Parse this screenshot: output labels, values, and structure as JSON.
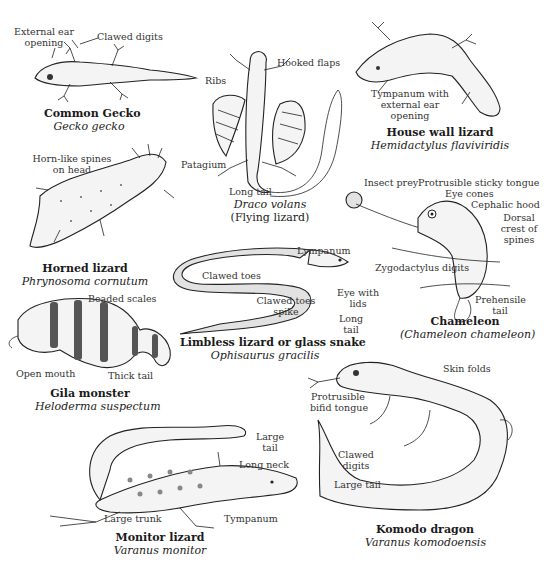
{
  "figure": {
    "specimens": [
      {
        "id": "common-gecko",
        "common_name": "Common Gecko",
        "scientific_name": "Gecko gecko",
        "labels": [
          "External ear opening",
          "Clawed digits"
        ]
      },
      {
        "id": "flying-lizard",
        "common_name": "(Flying lizard)",
        "scientific_name": "Draco volans",
        "labels": [
          "Hooked flaps",
          "Ribs",
          "Patagium",
          "Long tail"
        ]
      },
      {
        "id": "house-wall-lizard",
        "common_name": "House wall lizard",
        "scientific_name": "Hemidactylus flaviviridis",
        "labels": [
          "Tympanum with external ear opening"
        ]
      },
      {
        "id": "horned-lizard",
        "common_name": "Horned lizard",
        "scientific_name": "Phrynosoma cornutum",
        "labels": [
          "Horn-like spines on head"
        ]
      },
      {
        "id": "chameleon",
        "common_name": "Chameleon",
        "scientific_name": "(Chameleon chameleon)",
        "labels": [
          "Insect prey",
          "Protrusible sticky tongue",
          "Eye cones",
          "Cephalic hood",
          "Dorsal crest of spines",
          "Zygodactylus digits",
          "Prehensile tail"
        ]
      },
      {
        "id": "glass-snake",
        "common_name": "Limbless lizard or glass snake",
        "scientific_name": "Ophisaurus gracilis",
        "labels": [
          "Lympanum",
          "Clawed toes",
          "Clawed toes spike",
          "Eye with lids",
          "Long tail"
        ]
      },
      {
        "id": "gila-monster",
        "common_name": "Gila monster",
        "scientific_name": "Heloderma suspectum",
        "labels": [
          "Beaded scales",
          "Open mouth",
          "Thick tail"
        ]
      },
      {
        "id": "komodo-dragon",
        "common_name": "Komodo dragon",
        "scientific_name": "Varanus komodoensis",
        "labels": [
          "Skin folds",
          "Protrusible bifid tongue",
          "Clawed digits",
          "Large tail"
        ]
      },
      {
        "id": "monitor-lizard",
        "common_name": "Monitor lizard",
        "scientific_name": "Varanus monitor",
        "labels": [
          "Large tail",
          "Long neck",
          "Large trunk",
          "Tympanum"
        ]
      }
    ]
  },
  "text": {
    "gecko": {
      "ear_1": "External ear",
      "ear_2": "opening",
      "digits": "Clawed digits",
      "cn": "Common Gecko",
      "sn": "Gecko gecko"
    },
    "draco": {
      "flaps": "Hooked flaps",
      "ribs": "Ribs",
      "patagium": "Patagium",
      "tail": "Long tail",
      "sn": "Draco volans",
      "cn": "(Flying lizard)"
    },
    "house": {
      "tym_1": "Tympanum with",
      "tym_2": "external ear",
      "tym_3": "opening",
      "cn": "House wall lizard",
      "sn": "Hemidactylus flaviviridis"
    },
    "horned": {
      "spines_1": "Horn-like spines",
      "spines_2": "on head",
      "cn": "Horned lizard",
      "sn": "Phrynosoma cornutum"
    },
    "chameleon": {
      "prey": "Insect prey",
      "tongue": "Protrusible sticky tongue",
      "eye": "Eye cones",
      "hood": "Cephalic hood",
      "crest_1": "Dorsal",
      "crest_2": "crest of",
      "crest_3": "spines",
      "zygo": "Zygodactylus digits",
      "tail_1": "Prehensile",
      "tail_2": "tail",
      "cn": "Chameleon",
      "sn": "(Chameleon chameleon)"
    },
    "glass": {
      "lymp": "Lympanum",
      "toes": "Clawed toes",
      "spike_1": "Clawed toes",
      "spike_2": "spike",
      "eye_1": "Eye with",
      "eye_2": "lids",
      "tail_1": "Long",
      "tail_2": "tail",
      "cn": "Limbless lizard or glass snake",
      "sn": "Ophisaurus gracilis"
    },
    "gila": {
      "beads": "Beaded scales",
      "mouth": "Open mouth",
      "tail": "Thick tail",
      "cn": "Gila monster",
      "sn": "Heloderma suspectum"
    },
    "komodo": {
      "folds": "Skin folds",
      "tongue_1": "Protrusible",
      "tongue_2": "bifid tongue",
      "digits_1": "Clawed",
      "digits_2": "digits",
      "tail": "Large tail",
      "cn": "Komodo dragon",
      "sn": "Varanus komodoensis"
    },
    "monitor": {
      "tail_1": "Large",
      "tail_2": "tail",
      "neck": "Long neck",
      "trunk": "Large trunk",
      "tym": "Tympanum",
      "cn": "Monitor lizard",
      "sn": "Varanus monitor"
    }
  }
}
